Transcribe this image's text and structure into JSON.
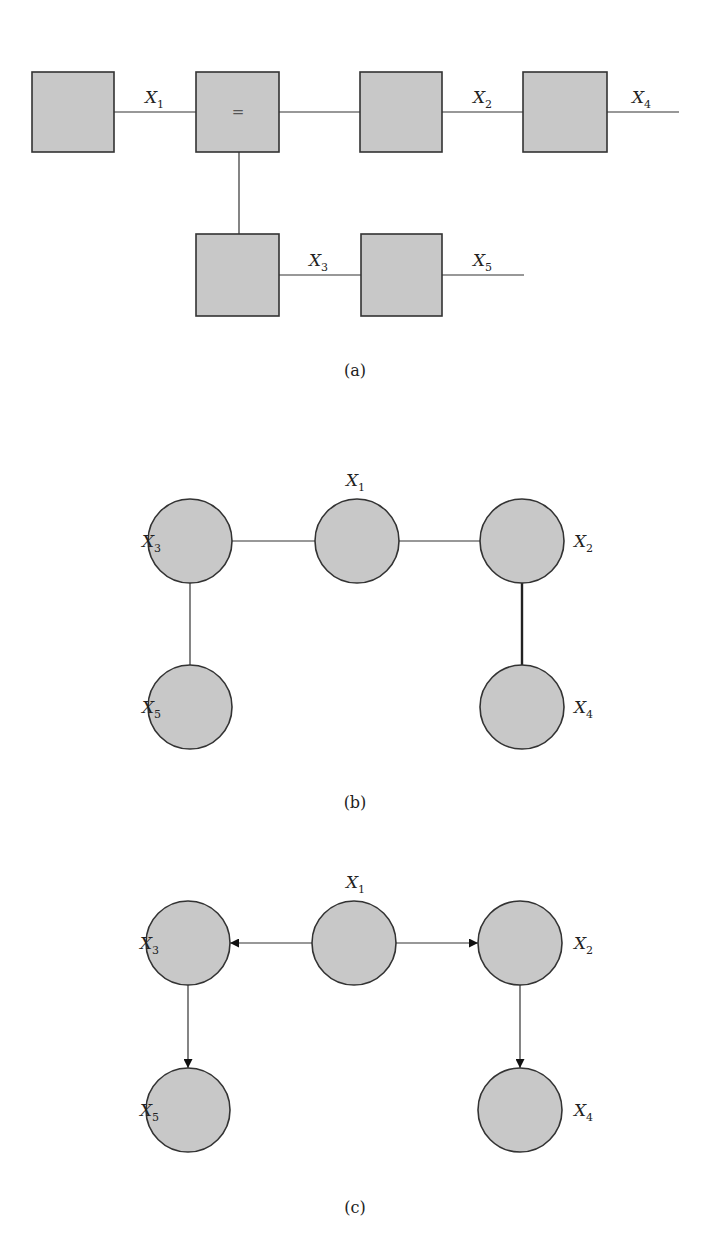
{
  "figure_a": {
    "caption": "(a)",
    "equality_symbol": "=",
    "labels": {
      "x1": {
        "base": "X",
        "sub": "1"
      },
      "x2": {
        "base": "X",
        "sub": "2"
      },
      "x3": {
        "base": "X",
        "sub": "3"
      },
      "x4": {
        "base": "X",
        "sub": "4"
      },
      "x5": {
        "base": "X",
        "sub": "5"
      }
    }
  },
  "figure_b": {
    "caption": "(b)",
    "nodes": {
      "x1": {
        "base": "X",
        "sub": "1"
      },
      "x2": {
        "base": "X",
        "sub": "2"
      },
      "x3": {
        "base": "X",
        "sub": "3"
      },
      "x4": {
        "base": "X",
        "sub": "4"
      },
      "x5": {
        "base": "X",
        "sub": "5"
      }
    }
  },
  "figure_c": {
    "caption": "(c)",
    "nodes": {
      "x1": {
        "base": "X",
        "sub": "1"
      },
      "x2": {
        "base": "X",
        "sub": "2"
      },
      "x3": {
        "base": "X",
        "sub": "3"
      },
      "x4": {
        "base": "X",
        "sub": "4"
      },
      "x5": {
        "base": "X",
        "sub": "5"
      }
    }
  },
  "colors": {
    "node_fill": "#c8c8c8",
    "stroke": "#333333"
  }
}
